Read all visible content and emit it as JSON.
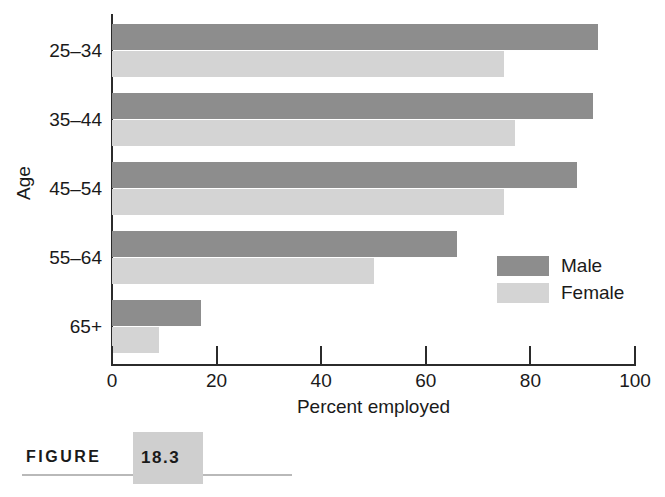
{
  "chart_data": {
    "type": "bar",
    "orientation": "horizontal",
    "title": "",
    "xlabel": "Percent employed",
    "ylabel": "Age",
    "categories": [
      "25–34",
      "35–44",
      "45–54",
      "55–64",
      "65+"
    ],
    "series": [
      {
        "name": "Male",
        "color": "#8d8d8d",
        "values": [
          93,
          92,
          89,
          66,
          17
        ]
      },
      {
        "name": "Female",
        "color": "#d4d4d4",
        "values": [
          75,
          77,
          75,
          50,
          9
        ]
      }
    ],
    "xlim": [
      0,
      100
    ],
    "xticks": [
      0,
      20,
      40,
      60,
      80,
      100
    ],
    "xtick_labels": [
      "0",
      "20",
      "40",
      "60",
      "80",
      "100"
    ],
    "grid": false,
    "legend_position": "inside-right"
  },
  "legend": {
    "items": [
      {
        "label": "Male",
        "swatch": "male"
      },
      {
        "label": "Female",
        "swatch": "female"
      }
    ]
  },
  "caption": {
    "word": "FIGURE",
    "number": "18.3"
  }
}
